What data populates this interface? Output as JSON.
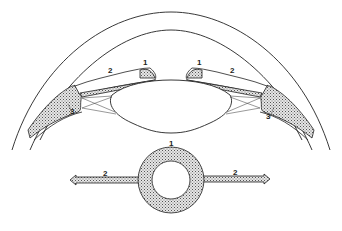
{
  "diagram": {
    "colors": {
      "line": "#222222",
      "fill": "#c8c8c8",
      "background": "#ffffff"
    },
    "upper_view": {
      "labels": [
        {
          "id": "left-1",
          "text": "1",
          "x": 143,
          "y": 63
        },
        {
          "id": "left-2",
          "text": "2",
          "x": 108,
          "y": 71
        },
        {
          "id": "left-3",
          "text": "3",
          "x": 71,
          "y": 112
        },
        {
          "id": "right-1",
          "text": "1",
          "x": 198,
          "y": 63
        },
        {
          "id": "right-2",
          "text": "2",
          "x": 231,
          "y": 71
        },
        {
          "id": "right-3",
          "text": "3",
          "x": 267,
          "y": 117
        }
      ]
    },
    "lower_view": {
      "labels": [
        {
          "id": "ring-1",
          "text": "1",
          "x": 170,
          "y": 144
        },
        {
          "id": "arrow-left-2",
          "text": "2",
          "x": 104,
          "y": 178
        },
        {
          "id": "arrow-right-2",
          "text": "2",
          "x": 234,
          "y": 175
        }
      ]
    }
  }
}
